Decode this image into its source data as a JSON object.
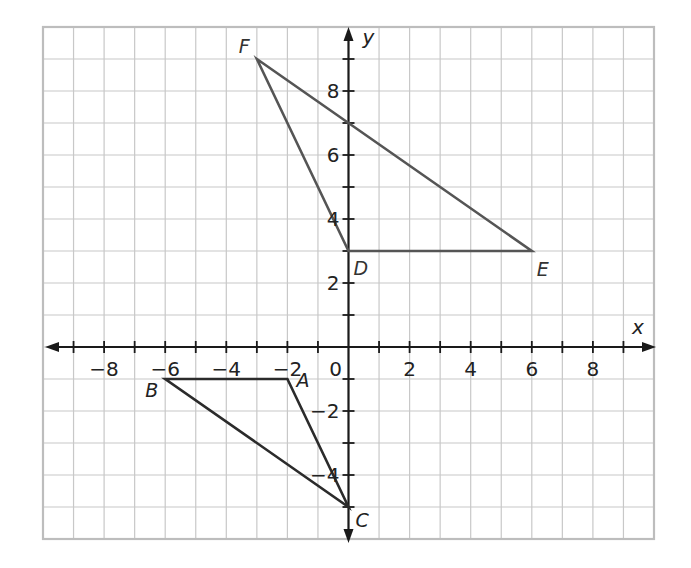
{
  "chart_data": {
    "type": "coordinate-plane",
    "title": "",
    "xlabel": "x",
    "ylabel": "y",
    "xlim": [
      -10,
      10
    ],
    "ylim": [
      -6,
      10
    ],
    "grid": true,
    "x_tick_labels": [
      {
        "value": -8,
        "label": "−8"
      },
      {
        "value": -6,
        "label": "−6"
      },
      {
        "value": -4,
        "label": "−4"
      },
      {
        "value": -2,
        "label": "−2"
      },
      {
        "value": 0,
        "label": "0"
      },
      {
        "value": 2,
        "label": "2"
      },
      {
        "value": 4,
        "label": "4"
      },
      {
        "value": 6,
        "label": "6"
      },
      {
        "value": 8,
        "label": "8"
      }
    ],
    "y_tick_labels": [
      {
        "value": 8,
        "label": "8"
      },
      {
        "value": 6,
        "label": "6"
      },
      {
        "value": 4,
        "label": "4"
      },
      {
        "value": 2,
        "label": "2"
      },
      {
        "value": -2,
        "label": "−2"
      },
      {
        "value": -4,
        "label": "−4"
      }
    ],
    "shapes": [
      {
        "name": "triangle ABC",
        "color": "#2b2b2b",
        "vertices": [
          {
            "label": "A",
            "x": -2,
            "y": -1
          },
          {
            "label": "B",
            "x": -6,
            "y": -1
          },
          {
            "label": "C",
            "x": 0,
            "y": -5
          }
        ]
      },
      {
        "name": "triangle DEF",
        "color": "#555555",
        "vertices": [
          {
            "label": "D",
            "x": 0,
            "y": 3
          },
          {
            "label": "E",
            "x": 6,
            "y": 3
          },
          {
            "label": "F",
            "x": -3,
            "y": 9
          }
        ]
      }
    ]
  }
}
